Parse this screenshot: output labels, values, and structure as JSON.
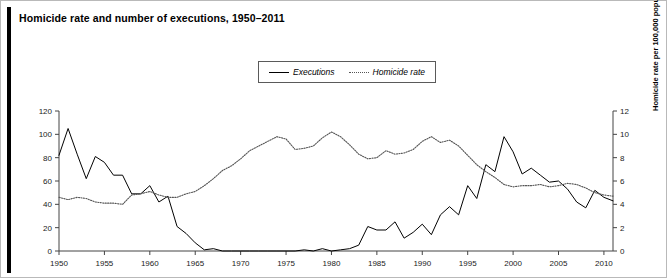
{
  "figure": {
    "title": "Homicide rate and number of executions, 1950–2011",
    "accent_color": "#000000",
    "border_color": "#b9b9b9",
    "background": "#ffffff"
  },
  "legend": {
    "position": "top-center",
    "entries": [
      {
        "label": "Executions",
        "style": "solid",
        "color": "#000000",
        "icon": "solid-line-icon"
      },
      {
        "label": "Homicide rate",
        "style": "dotted",
        "color": "#555555",
        "icon": "dotted-line-icon"
      }
    ]
  },
  "axes": {
    "x": {
      "label": "",
      "ticks": [
        "1950",
        "1955",
        "1960",
        "1965",
        "1970",
        "1975",
        "1980",
        "1985",
        "1990",
        "1995",
        "2000",
        "2005",
        "2010"
      ],
      "min": 1950,
      "max": 2011
    },
    "y_left": {
      "label": "Number of executions",
      "ticks": [
        "0",
        "20",
        "40",
        "60",
        "80",
        "100",
        "120"
      ],
      "min": 0,
      "max": 120
    },
    "y_right": {
      "label": "Homicide rate per 100,000 population",
      "ticks": [
        "0",
        "2",
        "4",
        "6",
        "8",
        "10",
        "12"
      ],
      "min": 0,
      "max": 12
    }
  },
  "chart_data": {
    "type": "line",
    "title": "Homicide rate and number of executions, 1950–2011",
    "xlabel": "",
    "ylabel": "Number of executions",
    "y2label": "Homicide rate per 100,000 population",
    "xlim": [
      1950,
      2011
    ],
    "ylim": [
      0,
      120
    ],
    "y2lim": [
      0,
      12
    ],
    "grid": false,
    "legend_position": "top-center",
    "x": [
      1950,
      1951,
      1952,
      1953,
      1954,
      1955,
      1956,
      1957,
      1958,
      1959,
      1960,
      1961,
      1962,
      1963,
      1964,
      1965,
      1966,
      1967,
      1968,
      1969,
      1970,
      1971,
      1972,
      1973,
      1974,
      1975,
      1976,
      1977,
      1978,
      1979,
      1980,
      1981,
      1982,
      1983,
      1984,
      1985,
      1986,
      1987,
      1988,
      1989,
      1990,
      1991,
      1992,
      1993,
      1994,
      1995,
      1996,
      1997,
      1998,
      1999,
      2000,
      2001,
      2002,
      2003,
      2004,
      2005,
      2006,
      2007,
      2008,
      2009,
      2010,
      2011
    ],
    "series": [
      {
        "name": "Executions",
        "axis": "left",
        "style": "solid",
        "color": "#000000",
        "values": [
          82,
          105,
          83,
          62,
          81,
          76,
          65,
          65,
          49,
          49,
          56,
          42,
          47,
          21,
          15,
          7,
          1,
          2,
          0,
          0,
          0,
          0,
          0,
          0,
          0,
          0,
          0,
          1,
          0,
          2,
          0,
          1,
          2,
          5,
          21,
          18,
          18,
          25,
          11,
          16,
          23,
          14,
          31,
          38,
          31,
          56,
          45,
          74,
          68,
          98,
          85,
          66,
          71,
          65,
          59,
          60,
          53,
          42,
          37,
          52,
          46,
          43
        ]
      },
      {
        "name": "Homicide rate",
        "axis": "right",
        "style": "dotted",
        "color": "#555555",
        "values": [
          4.6,
          4.4,
          4.6,
          4.5,
          4.2,
          4.1,
          4.1,
          4.0,
          4.8,
          4.9,
          5.1,
          4.8,
          4.6,
          4.6,
          4.9,
          5.1,
          5.6,
          6.2,
          6.9,
          7.3,
          7.9,
          8.6,
          9.0,
          9.4,
          9.8,
          9.6,
          8.7,
          8.8,
          9.0,
          9.7,
          10.2,
          9.8,
          9.1,
          8.3,
          7.9,
          8.0,
          8.6,
          8.3,
          8.4,
          8.7,
          9.4,
          9.8,
          9.3,
          9.5,
          9.0,
          8.2,
          7.4,
          6.8,
          6.3,
          5.7,
          5.5,
          5.6,
          5.6,
          5.7,
          5.5,
          5.6,
          5.8,
          5.7,
          5.4,
          5.0,
          4.8,
          4.7
        ]
      }
    ]
  }
}
